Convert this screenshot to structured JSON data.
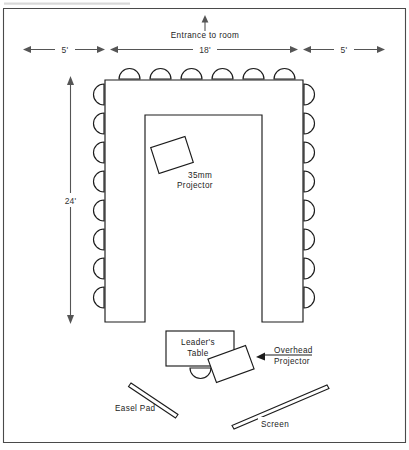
{
  "page": {
    "width": 409,
    "height": 450,
    "background": "#ffffff",
    "ink_color": "#1c1c1c",
    "frame_color": "#4a4a4a"
  },
  "masthead": {
    "cropped_text": "",
    "note": "partially cropped header strip at very top edge"
  },
  "entrance": {
    "label": "Entrance to room",
    "arrow_direction": "up"
  },
  "dimensions": {
    "horizontal": [
      {
        "id": "left-aisle",
        "label": "5'"
      },
      {
        "id": "table-span",
        "label": "18'"
      },
      {
        "id": "right-aisle",
        "label": "5'"
      }
    ],
    "vertical": [
      {
        "id": "room-depth",
        "label": "24'"
      }
    ]
  },
  "furniture": {
    "u_table": {
      "name": "U-shaped conference table",
      "outer": {
        "x": 105,
        "y": 80,
        "width": 198,
        "height": 242
      },
      "notch": {
        "x": 145,
        "y": 115,
        "width": 117,
        "height": 207
      }
    },
    "leaders_table": {
      "label_line1": "Leader's",
      "label_line2": "Table",
      "x": 166,
      "y": 331,
      "width": 68,
      "height": 35
    },
    "chairs": {
      "top_count": 6,
      "left_count": 8,
      "right_count": 8,
      "leader_count": 1
    }
  },
  "equipment": [
    {
      "id": "projector-35mm",
      "label_line1": "35mm",
      "label_line2": "Projector",
      "shape": "rotated-rectangle",
      "cx": 172,
      "cy": 155,
      "width": 36,
      "height": 27,
      "rotation": -18
    },
    {
      "id": "overhead-projector",
      "label_line1": "Overhead",
      "label_line2": "Projector",
      "shape": "rotated-rectangle",
      "cx": 231,
      "cy": 364,
      "width": 40,
      "height": 25,
      "rotation": -20
    },
    {
      "id": "easel-pad",
      "label": "Easel Pad",
      "shape": "thin-bar"
    },
    {
      "id": "screen",
      "label": "Screen",
      "shape": "thin-bar"
    }
  ]
}
